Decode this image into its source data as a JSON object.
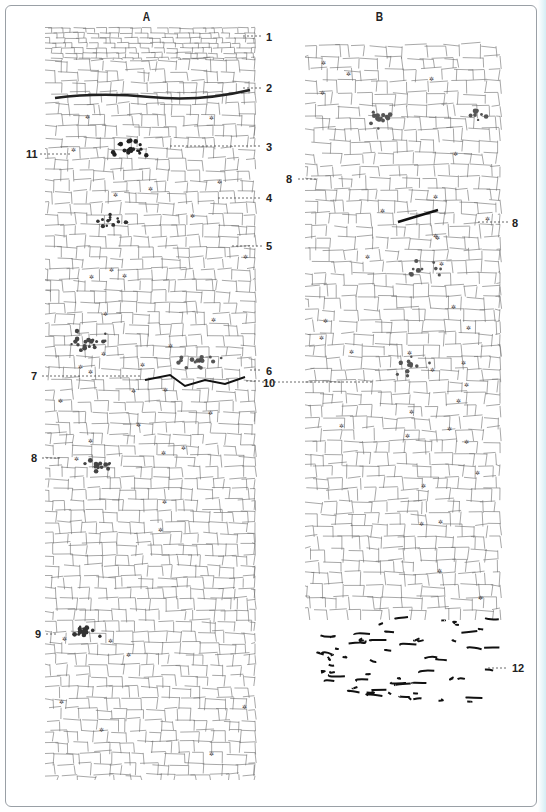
{
  "figure": {
    "panels": [
      {
        "id": "A",
        "label": "A"
      },
      {
        "id": "B",
        "label": "B"
      }
    ],
    "annotations": [
      {
        "label": "1",
        "panel": "A",
        "side": "right"
      },
      {
        "label": "2",
        "panel": "A",
        "side": "right"
      },
      {
        "label": "3",
        "panel": "A",
        "side": "right"
      },
      {
        "label": "4",
        "panel": "A",
        "side": "right"
      },
      {
        "label": "5",
        "panel": "A",
        "side": "right"
      },
      {
        "label": "6",
        "panel": "A",
        "side": "right"
      },
      {
        "label": "7",
        "panel": "A",
        "side": "left"
      },
      {
        "label": "8",
        "panel": "A",
        "side": "left"
      },
      {
        "label": "9",
        "panel": "A",
        "side": "left"
      },
      {
        "label": "10",
        "panel": "A",
        "side": "right"
      },
      {
        "label": "11",
        "panel": "A",
        "side": "left"
      },
      {
        "label": "8",
        "panel": "B",
        "side": "left"
      },
      {
        "label": "8",
        "panel": "B",
        "side": "right"
      },
      {
        "label": "12",
        "panel": "B",
        "side": "right"
      }
    ]
  }
}
